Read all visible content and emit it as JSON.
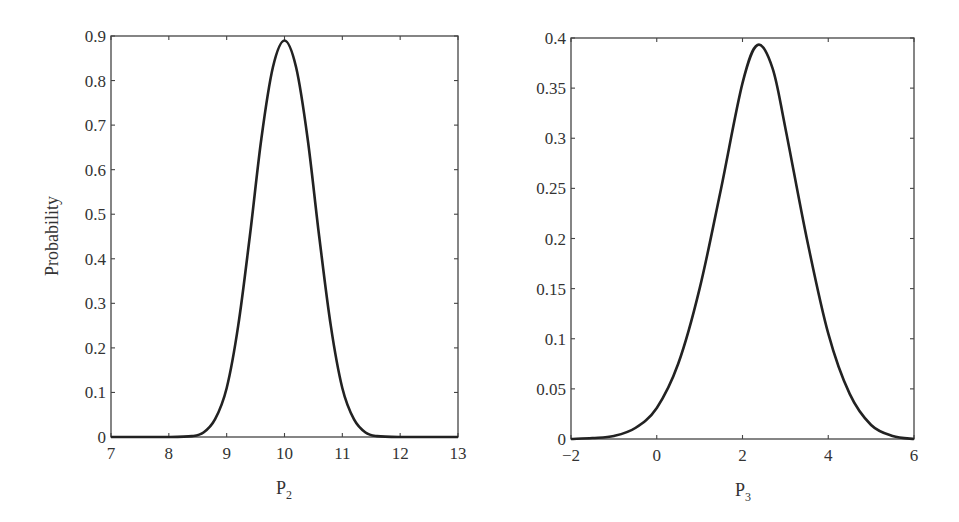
{
  "chart_data": [
    {
      "type": "line",
      "title": "",
      "xlabel": "P2",
      "xlabel_main": "P",
      "xlabel_sub": "2",
      "ylabel": "Probability",
      "xlim": [
        7,
        13
      ],
      "ylim": [
        0,
        0.9
      ],
      "xticks": [
        "7",
        "8",
        "9",
        "10",
        "11",
        "12",
        "13"
      ],
      "yticks": [
        "0",
        "0.1",
        "0.2",
        "0.3",
        "0.4",
        "0.5",
        "0.6",
        "0.7",
        "0.8",
        "0.9"
      ],
      "grid": false,
      "legend": null,
      "series": [
        {
          "name": "P2 distribution",
          "x": [
            7.0,
            8.0,
            8.4,
            8.6,
            8.8,
            9.0,
            9.2,
            9.4,
            9.6,
            9.8,
            10.0,
            10.2,
            10.4,
            10.6,
            10.8,
            11.0,
            11.2,
            11.4,
            11.6,
            12.0,
            13.0
          ],
          "y": [
            0.0,
            0.0,
            0.002,
            0.01,
            0.04,
            0.11,
            0.25,
            0.45,
            0.67,
            0.83,
            0.89,
            0.83,
            0.67,
            0.45,
            0.25,
            0.11,
            0.04,
            0.01,
            0.002,
            0.0,
            0.0
          ]
        }
      ]
    },
    {
      "type": "line",
      "title": "",
      "xlabel": "P3",
      "xlabel_main": "P",
      "xlabel_sub": "3",
      "ylabel": "",
      "xlim": [
        -2,
        6
      ],
      "ylim": [
        0,
        0.4
      ],
      "xticks": [
        "−2",
        "0",
        "2",
        "4",
        "6"
      ],
      "yticks": [
        "0",
        "0.05",
        "0.1",
        "0.15",
        "0.2",
        "0.25",
        "0.3",
        "0.35",
        "0.4"
      ],
      "grid": false,
      "legend": null,
      "series": [
        {
          "name": "P3 distribution",
          "x": [
            -2.0,
            -1.5,
            -1.0,
            -0.5,
            0.0,
            0.5,
            1.0,
            1.5,
            2.0,
            2.35,
            2.7,
            3.0,
            3.5,
            4.0,
            4.5,
            5.0,
            5.5,
            6.0
          ],
          "y": [
            0.0,
            0.001,
            0.003,
            0.011,
            0.031,
            0.075,
            0.15,
            0.25,
            0.355,
            0.393,
            0.37,
            0.31,
            0.2,
            0.105,
            0.045,
            0.014,
            0.003,
            0.0
          ]
        }
      ]
    }
  ]
}
